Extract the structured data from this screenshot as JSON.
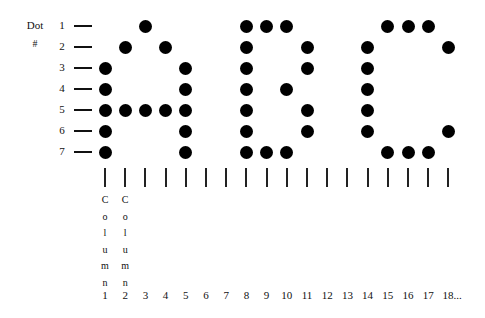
{
  "title": {
    "line1": "Dot",
    "line2": "#"
  },
  "rows": [
    "1",
    "2",
    "3",
    "4",
    "5",
    "6",
    "7"
  ],
  "columns": [
    "1",
    "2",
    "3",
    "4",
    "5",
    "6",
    "7",
    "8",
    "9",
    "10",
    "11",
    "12",
    "13",
    "14",
    "15",
    "16",
    "17",
    "18..."
  ],
  "column_word": "Column",
  "column_word_shown_for": [
    1,
    2
  ],
  "letters": [
    {
      "letter": "A",
      "dots": [
        [
          1,
          3
        ],
        [
          2,
          2
        ],
        [
          2,
          4
        ],
        [
          3,
          1
        ],
        [
          3,
          5
        ],
        [
          4,
          1
        ],
        [
          4,
          5
        ],
        [
          5,
          1
        ],
        [
          5,
          2
        ],
        [
          5,
          3
        ],
        [
          5,
          4
        ],
        [
          5,
          5
        ],
        [
          6,
          1
        ],
        [
          6,
          5
        ],
        [
          7,
          1
        ],
        [
          7,
          5
        ]
      ]
    },
    {
      "letter": "B",
      "dots": [
        [
          1,
          8
        ],
        [
          1,
          9
        ],
        [
          1,
          10
        ],
        [
          2,
          8
        ],
        [
          2,
          11
        ],
        [
          3,
          8
        ],
        [
          3,
          11
        ],
        [
          4,
          8
        ],
        [
          4,
          10
        ],
        [
          5,
          8
        ],
        [
          5,
          11
        ],
        [
          6,
          8
        ],
        [
          6,
          11
        ],
        [
          7,
          8
        ],
        [
          7,
          9
        ],
        [
          7,
          10
        ]
      ]
    },
    {
      "letter": "C",
      "dots": [
        [
          1,
          15
        ],
        [
          1,
          16
        ],
        [
          1,
          17
        ],
        [
          2,
          14
        ],
        [
          2,
          18
        ],
        [
          3,
          14
        ],
        [
          4,
          14
        ],
        [
          5,
          14
        ],
        [
          6,
          14
        ],
        [
          6,
          18
        ],
        [
          7,
          15
        ],
        [
          7,
          16
        ],
        [
          7,
          17
        ]
      ]
    }
  ],
  "dot_color": "#000000"
}
